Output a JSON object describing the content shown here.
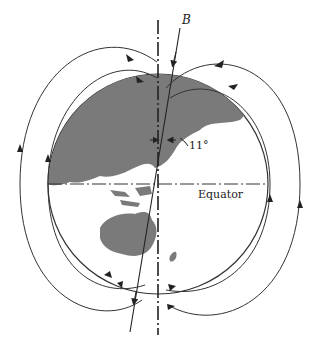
{
  "diagram": {
    "labels": {
      "magnetic_axis": "B",
      "tilt_angle": "11°",
      "equator": "Equator"
    },
    "colors": {
      "background": "#ffffff",
      "lines": "#333333",
      "land": "#7a7a7a",
      "ocean": "#ffffff"
    }
  }
}
